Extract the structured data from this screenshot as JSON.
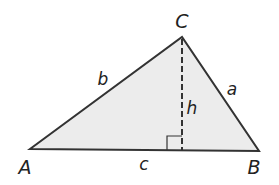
{
  "diagram": {
    "vertices": {
      "A": {
        "label": "A",
        "x": 30,
        "y": 149
      },
      "B": {
        "label": "B",
        "x": 259,
        "y": 151
      },
      "C": {
        "label": "C",
        "x": 182,
        "y": 37
      }
    },
    "foot": {
      "x": 182,
      "y": 150
    },
    "labels": {
      "vertex_a": "A",
      "vertex_b": "B",
      "vertex_c": "C",
      "side_a": "a",
      "side_b": "b",
      "side_c": "c",
      "height": "h"
    },
    "colors": {
      "fill": "#ececec",
      "stroke": "#333333",
      "text": "#222222"
    }
  }
}
